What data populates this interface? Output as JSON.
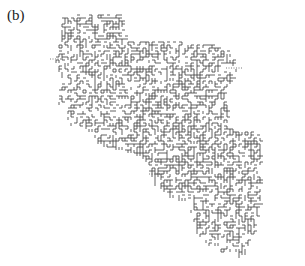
{
  "figure": {
    "panel_label": "(b)",
    "colors": {
      "background": "#ffffff",
      "segments": "#3a3a3a",
      "dotted_leads": "#555555"
    },
    "grid_step": 3,
    "dotted_leads": [
      {
        "x1": 50,
        "y1": 59,
        "x2": 61,
        "y2": 59
      },
      {
        "x1": 226,
        "y1": 68,
        "x2": 242,
        "y2": 68
      },
      {
        "x1": 149,
        "y1": 174,
        "x2": 164,
        "y2": 174
      }
    ],
    "cluster_outline": [
      [
        62,
        18
      ],
      [
        80,
        14
      ],
      [
        120,
        14
      ],
      [
        128,
        40
      ],
      [
        165,
        40
      ],
      [
        210,
        44
      ],
      [
        232,
        52
      ],
      [
        238,
        70
      ],
      [
        226,
        90
      ],
      [
        228,
        118
      ],
      [
        230,
        128
      ],
      [
        262,
        134
      ],
      [
        262,
        200
      ],
      [
        255,
        230
      ],
      [
        245,
        254
      ],
      [
        228,
        258
      ],
      [
        205,
        240
      ],
      [
        195,
        230
      ],
      [
        187,
        200
      ],
      [
        170,
        196
      ],
      [
        152,
        182
      ],
      [
        146,
        160
      ],
      [
        125,
        150
      ],
      [
        110,
        148
      ],
      [
        100,
        145
      ],
      [
        92,
        130
      ],
      [
        70,
        125
      ],
      [
        65,
        110
      ],
      [
        56,
        100
      ],
      [
        62,
        80
      ],
      [
        55,
        60
      ],
      [
        60,
        40
      ]
    ]
  }
}
